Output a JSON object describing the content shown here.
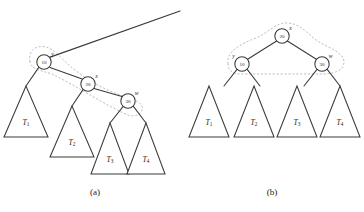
{
  "figure": {
    "panels": [
      {
        "id": "a",
        "caption": "(a)",
        "caption_x": 95,
        "caption_y": 192,
        "nodes": [
          {
            "name": "y",
            "value": "10",
            "cx": 44,
            "cy": 62,
            "r": 7.2,
            "label_dx": 8.5,
            "label_dy": -8.0
          },
          {
            "name": "x",
            "value": "20",
            "cx": 88,
            "cy": 84,
            "r": 7.2,
            "label_dx": 8.5,
            "label_dy": -8.0
          },
          {
            "name": "w",
            "value": "30",
            "cx": 128,
            "cy": 101,
            "r": 7.2,
            "label_dx": 8.5,
            "label_dy": -8.5
          }
        ],
        "edges": [
          {
            "x1": 49.5,
            "y1": 57.4,
            "x2": 180,
            "y2": 11
          },
          {
            "x1": 38.6,
            "y1": 67.6,
            "x2": 26,
            "y2": 86
          },
          {
            "x1": 50.0,
            "y1": 67.4,
            "x2": 82.2,
            "y2": 79.0
          },
          {
            "x1": 83.2,
            "y1": 89.4,
            "x2": 72,
            "y2": 106
          },
          {
            "x1": 94.0,
            "y1": 88.4,
            "x2": 122.0,
            "y2": 96.4
          },
          {
            "x1": 123.0,
            "y1": 106.6,
            "x2": 110,
            "y2": 123
          },
          {
            "x1": 133.4,
            "y1": 106.4,
            "x2": 146,
            "y2": 123
          }
        ],
        "triangles": [
          {
            "label": "T",
            "sub": "1",
            "apex_x": 26,
            "apex_y": 86,
            "base_y": 137,
            "half_width": 22,
            "label_y": 122
          },
          {
            "label": "T",
            "sub": "2",
            "apex_x": 72,
            "apex_y": 106,
            "base_y": 157,
            "half_width": 22,
            "label_y": 142
          },
          {
            "label": "T",
            "sub": "3",
            "apex_x": 110,
            "apex_y": 123,
            "base_y": 174,
            "half_width": 19,
            "label_y": 159
          },
          {
            "label": "T",
            "sub": "4",
            "apex_x": 146,
            "apex_y": 123,
            "base_y": 174,
            "half_width": 19,
            "label_y": 159
          }
        ],
        "highlight_path": "M 30 62 C 28 50, 36 45, 46 47 C 54 49, 60 57, 70 66 C 82 76, 94 84, 110 91 C 126 98, 140 100, 142 106 C 144 113, 136 118, 128 115 C 118 111, 104 103, 92 96 C 78 88, 64 80, 52 74 C 40 70, 32 70, 30 62 Z"
      },
      {
        "id": "b",
        "caption": "(b)",
        "caption_x": 272,
        "caption_y": 192,
        "nodes": [
          {
            "name": "x",
            "value": "20",
            "cx": 282,
            "cy": 36,
            "r": 7.2,
            "label_dx": 8.5,
            "label_dy": -8.0
          },
          {
            "name": "y",
            "value": "10",
            "cx": 242,
            "cy": 64,
            "r": 7.2,
            "label_dx": -8.5,
            "label_dy": -8.0
          },
          {
            "name": "w",
            "value": "30",
            "cx": 322,
            "cy": 64,
            "r": 7.2,
            "label_dx": 8.5,
            "label_dy": -8.0
          }
        ],
        "edges": [
          {
            "x1": 276.6,
            "y1": 41.0,
            "x2": 247.6,
            "y2": 59.2
          },
          {
            "x1": 287.4,
            "y1": 41.0,
            "x2": 316.4,
            "y2": 59.2
          },
          {
            "x1": 237.0,
            "y1": 69.4,
            "x2": 224,
            "y2": 86
          },
          {
            "x1": 247.2,
            "y1": 69.4,
            "x2": 260,
            "y2": 86
          },
          {
            "x1": 317.0,
            "y1": 69.4,
            "x2": 304,
            "y2": 86
          },
          {
            "x1": 327.2,
            "y1": 69.4,
            "x2": 340,
            "y2": 86
          }
        ],
        "triangles": [
          {
            "label": "T",
            "sub": "1",
            "apex_x": 209,
            "apex_y": 86,
            "base_y": 137,
            "half_width": 20,
            "label_y": 122
          },
          {
            "label": "T",
            "sub": "2",
            "apex_x": 254,
            "apex_y": 86,
            "base_y": 137,
            "half_width": 20,
            "label_y": 122
          },
          {
            "label": "T",
            "sub": "3",
            "apex_x": 297,
            "apex_y": 86,
            "base_y": 137,
            "half_width": 20,
            "label_y": 122
          },
          {
            "label": "T",
            "sub": "4",
            "apex_x": 340,
            "apex_y": 86,
            "base_y": 137,
            "half_width": 20,
            "label_y": 122
          }
        ],
        "highlight_path": "M 228 64 C 226 52, 240 44, 256 38 C 268 33, 276 22, 288 23 C 300 24, 306 32, 316 40 C 328 48, 344 52, 344 62 C 344 72, 332 74, 320 74 C 300 74, 262 74, 242 74 C 232 74, 228 70, 228 64 Z"
      }
    ]
  },
  "colors": {
    "stroke": "#3a3a3a",
    "highlight": "#b9b9b9",
    "background": "#ffffff",
    "text": "#1a1a1a"
  }
}
